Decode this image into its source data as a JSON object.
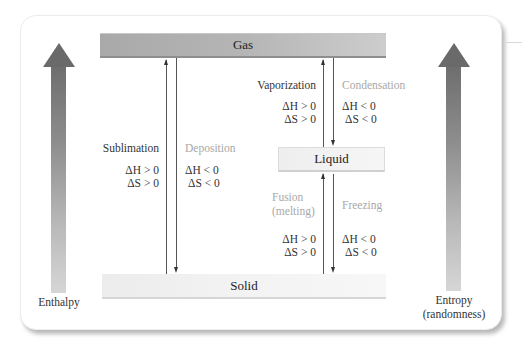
{
  "diagram": {
    "type": "phase-change energy diagram",
    "phases": {
      "gas": "Gas",
      "liquid": "Liquid",
      "solid": "Solid"
    },
    "axes": {
      "left": {
        "label": "Enthalpy",
        "direction": "up"
      },
      "right": {
        "label_line1": "Entropy",
        "label_line2": "(randomness)",
        "direction": "up"
      }
    },
    "transitions": [
      {
        "name": "Sublimation",
        "from": "Solid",
        "to": "Gas",
        "dH": "ΔH > 0",
        "dS": "ΔS > 0",
        "style": "dark"
      },
      {
        "name": "Deposition",
        "from": "Gas",
        "to": "Solid",
        "dH": "ΔH < 0",
        "dS": "ΔS < 0",
        "style": "light"
      },
      {
        "name": "Vaporization",
        "from": "Liquid",
        "to": "Gas",
        "dH": "ΔH > 0",
        "dS": "ΔS > 0",
        "style": "dark"
      },
      {
        "name": "Condensation",
        "from": "Gas",
        "to": "Liquid",
        "dH": "ΔH < 0",
        "dS": "ΔS < 0",
        "style": "light"
      },
      {
        "name_line1": "Fusion",
        "name_line2": "(melting)",
        "from": "Solid",
        "to": "Liquid",
        "dH": "ΔH > 0",
        "dS": "ΔS > 0",
        "style": "light"
      },
      {
        "name": "Freezing",
        "from": "Liquid",
        "to": "Solid",
        "dH": "ΔH < 0",
        "dS": "ΔS < 0",
        "style": "light"
      }
    ],
    "colors": {
      "gas_bar": "#b5b5b5",
      "solid_bar": "#f0f0f0",
      "liquid_box": "#f3f3f3",
      "arrow_dark": "#6a6a6a",
      "label_dark": "#333333",
      "label_light": "#a8a8a8"
    }
  }
}
